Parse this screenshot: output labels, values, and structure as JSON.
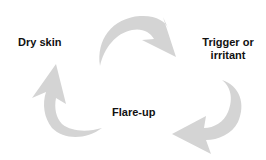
{
  "diagram": {
    "type": "cycle",
    "nodes": [
      {
        "id": "dry-skin",
        "label": "Dry skin"
      },
      {
        "id": "trigger",
        "label_line1": "Trigger or",
        "label_line2": "irritant"
      },
      {
        "id": "flare-up",
        "label": "Flare-up"
      }
    ],
    "edges": [
      {
        "from": "dry-skin",
        "to": "trigger"
      },
      {
        "from": "trigger",
        "to": "flare-up"
      },
      {
        "from": "flare-up",
        "to": "dry-skin"
      }
    ],
    "arrow_color": "#d4d4d4",
    "text_color": "#111111"
  }
}
